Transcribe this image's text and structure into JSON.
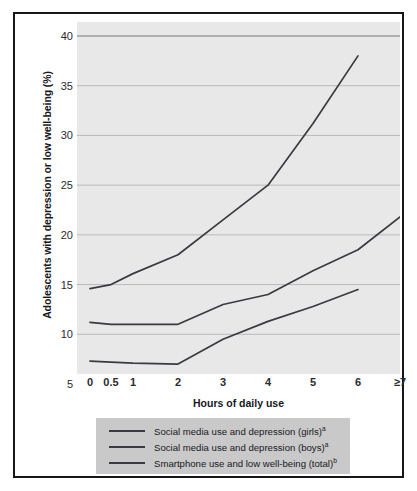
{
  "chart_data": {
    "type": "line",
    "title": "",
    "xlabel": "Hours of daily use",
    "ylabel": "Adolescents with depression or low well-being (%)",
    "categories": [
      "0",
      "0.5",
      "1",
      "2",
      "3",
      "4",
      "5",
      "6",
      "≥7"
    ],
    "ylim": [
      5,
      40
    ],
    "yticks": [
      5,
      10,
      15,
      20,
      25,
      30,
      35,
      40
    ],
    "grid": "horizontal",
    "legend_position": "below",
    "series": [
      {
        "name": "Social media use and depression (girls)",
        "note": "a",
        "x": [
          "0",
          "0.5",
          "1",
          "2",
          "3",
          "4",
          "5",
          "6"
        ],
        "values": [
          14.6,
          15.0,
          16.1,
          18.0,
          21.5,
          25.0,
          31.2,
          38.0
        ]
      },
      {
        "name": "Social media use and depression (boys)",
        "note": "a",
        "x": [
          "0",
          "0.5",
          "1",
          "2",
          "3",
          "4",
          "5",
          "6",
          "≥7"
        ],
        "values": [
          11.2,
          11.0,
          11.0,
          11.0,
          13.0,
          14.0,
          16.4,
          18.5,
          21.8
        ]
      },
      {
        "name": "Smartphone use and low well-being (total)",
        "note": "b",
        "x": [
          "0",
          "0.5",
          "1",
          "2",
          "3",
          "4",
          "5",
          "6"
        ],
        "values": [
          7.3,
          7.2,
          7.1,
          7.0,
          9.5,
          11.3,
          12.8,
          14.5
        ]
      }
    ]
  },
  "axis": {
    "y_label": "Adolescents with depression or low well-being (%)",
    "x_label": "Hours of daily use",
    "y_ticks": [
      "40",
      "35",
      "30",
      "25",
      "20",
      "15",
      "10",
      "5"
    ],
    "x_ticks": [
      "0",
      "0.5",
      "1",
      "2",
      "3",
      "4",
      "5",
      "6",
      "≥7"
    ]
  },
  "legend": {
    "items": [
      {
        "label": "Social media use and depression (girls)",
        "note": "a"
      },
      {
        "label": "Social media use and depression (boys)",
        "note": "a"
      },
      {
        "label": "Smartphone use and low well-being (total)",
        "note": "b"
      }
    ]
  },
  "colors": {
    "line": "#3a3b40",
    "plot_background": "#e8e8e8",
    "gridline": "#b9b9b9",
    "legend_background": "#c9c9c9",
    "frame": "#15161a",
    "page_background": "#ffffff"
  }
}
